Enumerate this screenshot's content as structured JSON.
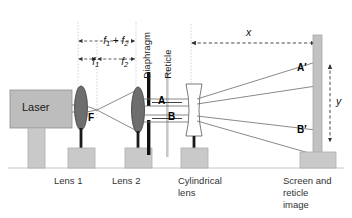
{
  "figure": {
    "background": "#ffffff"
  },
  "colors": {
    "lens_fill": "#6e6e6e",
    "lens_stroke": "#3a3a3a",
    "base_fill": "#c9c9c9",
    "base_stroke": "#a8a8a8",
    "laser_fill": "#bdbdbd",
    "laser_stroke": "#8f8f8f",
    "screen_fill": "#c2c2c2",
    "screen_stroke": "#a0a0a0",
    "diaphragm_fill": "#111111",
    "reticle_fill": "#c8c8c8",
    "ray_stroke": "#6b6b6b",
    "dim_stroke": "#333333",
    "guide_stroke": "#b9b9b9",
    "ground_stroke": "#bfbfbf",
    "text": "#1a1a1a"
  },
  "components": {
    "laser": {
      "label": "Laser"
    },
    "lens1": {
      "label": "Lens 1"
    },
    "lens2": {
      "label": "Lens 2"
    },
    "cylindrical_lens": {
      "label_line1": "Cylindrical",
      "label_line2": "lens"
    },
    "diaphragm": {
      "label": "Diaphragm"
    },
    "reticle": {
      "label": "Reticle"
    },
    "screen": {
      "label_line1": "Screen and",
      "label_line2": "reticle",
      "label_line3": "image"
    }
  },
  "points": {
    "focus": "F",
    "reticle_a": "A",
    "reticle_b": "B",
    "image_a": "A′",
    "image_b": "B′"
  },
  "dimensions": {
    "f_sum": {
      "base": "f",
      "sub1": "1",
      "operator": " + ",
      "base2": "f",
      "sub2": "2",
      "full": "f1 + f2"
    },
    "f1": {
      "base": "f",
      "sub": "1"
    },
    "f2": {
      "base": "f",
      "sub": "2"
    },
    "x": "x",
    "y": "y"
  }
}
